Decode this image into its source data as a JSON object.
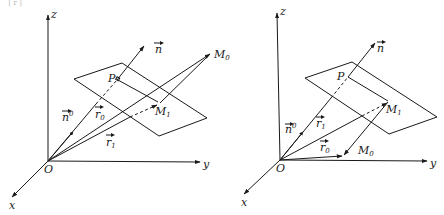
{
  "top_fragment": "| r |",
  "figures": [
    {
      "name": "left",
      "axes": {
        "z": "z",
        "y": "y",
        "x": "x",
        "origin": "O"
      },
      "points": {
        "P": "P",
        "M0": "M",
        "M0_sub": "0",
        "M1": "M",
        "M1_sub": "1"
      },
      "vectors": {
        "n": "n",
        "n0": "n",
        "n0_sup": "0",
        "r0": "r",
        "r0_sub": "0",
        "r1": "r",
        "r1_sub": "1"
      }
    },
    {
      "name": "right",
      "axes": {
        "z": "z",
        "y": "y",
        "x": "x",
        "origin": "O"
      },
      "points": {
        "P": "P",
        "M0": "M",
        "M0_sub": "0",
        "M1": "M",
        "M1_sub": "1"
      },
      "vectors": {
        "n": "n",
        "n0": "n",
        "n0_sup": "0",
        "r0": "r",
        "r0_sub": "0",
        "r1": "r",
        "r1_sub": "1"
      }
    }
  ]
}
